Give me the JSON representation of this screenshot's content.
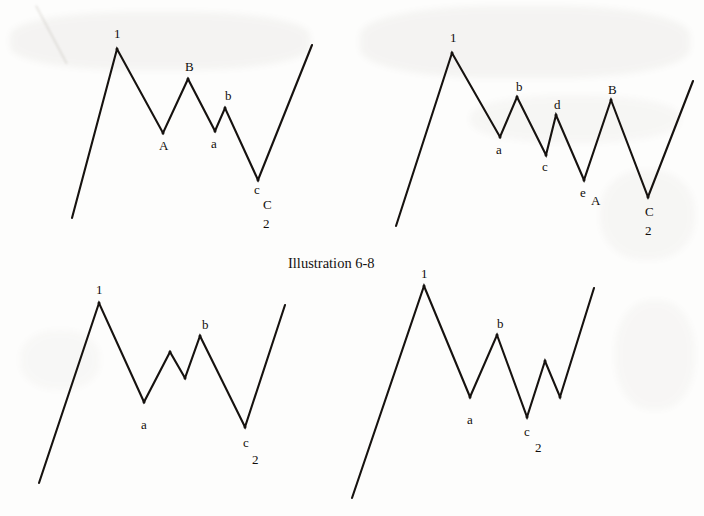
{
  "figure": {
    "caption": "Illustration 6-8",
    "caption_pos": {
      "x": 288,
      "y": 255
    },
    "background_color": "#fdfdfc",
    "line_color": "#16120f",
    "label_color": "#100d0b"
  },
  "charts": [
    {
      "id": "top-left",
      "name": "flat-correction-zigzag-top-left",
      "origin": {
        "x": 0,
        "y": 0
      },
      "points": [
        [
          72,
          218
        ],
        [
          117,
          49
        ],
        [
          163,
          133
        ],
        [
          188,
          79
        ],
        [
          215,
          131
        ],
        [
          225,
          108
        ],
        [
          258,
          180
        ],
        [
          312,
          45
        ]
      ],
      "labels": [
        {
          "text": "1",
          "x": 114,
          "y": 27
        },
        {
          "text": "A",
          "x": 159,
          "y": 139
        },
        {
          "text": "B",
          "x": 185,
          "y": 60
        },
        {
          "text": "a",
          "x": 211,
          "y": 137
        },
        {
          "text": "b",
          "x": 225,
          "y": 89
        },
        {
          "text": "c",
          "x": 254,
          "y": 183
        },
        {
          "text": "C",
          "x": 263,
          "y": 198
        },
        {
          "text": "2",
          "x": 263,
          "y": 217
        }
      ]
    },
    {
      "id": "top-right",
      "name": "zigzag-correction-top-right",
      "origin": {
        "x": 0,
        "y": 0
      },
      "points": [
        [
          396,
          226
        ],
        [
          452,
          53
        ],
        [
          500,
          137
        ],
        [
          517,
          97
        ],
        [
          546,
          155
        ],
        [
          556,
          115
        ],
        [
          584,
          180
        ],
        [
          611,
          100
        ],
        [
          648,
          197
        ],
        [
          693,
          81
        ]
      ],
      "labels": [
        {
          "text": "1",
          "x": 450,
          "y": 31
        },
        {
          "text": "a",
          "x": 496,
          "y": 143
        },
        {
          "text": "b",
          "x": 516,
          "y": 80
        },
        {
          "text": "c",
          "x": 542,
          "y": 160
        },
        {
          "text": "d",
          "x": 554,
          "y": 98
        },
        {
          "text": "e",
          "x": 580,
          "y": 186
        },
        {
          "text": "A",
          "x": 591,
          "y": 194
        },
        {
          "text": "B",
          "x": 608,
          "y": 83
        },
        {
          "text": "C",
          "x": 645,
          "y": 205
        },
        {
          "text": "2",
          "x": 645,
          "y": 224
        }
      ]
    },
    {
      "id": "bottom-left",
      "name": "zigzag-correction-bottom-left",
      "origin": {
        "x": 0,
        "y": 0
      },
      "points": [
        [
          39,
          483
        ],
        [
          99,
          303
        ],
        [
          144,
          402
        ],
        [
          170,
          352
        ],
        [
          185,
          378
        ],
        [
          200,
          336
        ],
        [
          245,
          427
        ],
        [
          285,
          305
        ]
      ],
      "labels": [
        {
          "text": "1",
          "x": 96,
          "y": 283
        },
        {
          "text": "a",
          "x": 141,
          "y": 418
        },
        {
          "text": "b",
          "x": 202,
          "y": 318
        },
        {
          "text": "c",
          "x": 243,
          "y": 436
        },
        {
          "text": "2",
          "x": 252,
          "y": 453
        }
      ]
    },
    {
      "id": "bottom-right",
      "name": "zigzag-correction-bottom-right",
      "origin": {
        "x": 0,
        "y": 0
      },
      "points": [
        [
          352,
          498
        ],
        [
          424,
          286
        ],
        [
          470,
          397
        ],
        [
          497,
          335
        ],
        [
          527,
          417
        ],
        [
          545,
          361
        ],
        [
          560,
          397
        ],
        [
          594,
          288
        ]
      ],
      "labels": [
        {
          "text": "1",
          "x": 421,
          "y": 267
        },
        {
          "text": "a",
          "x": 467,
          "y": 413
        },
        {
          "text": "b",
          "x": 497,
          "y": 317
        },
        {
          "text": "c",
          "x": 524,
          "y": 425
        },
        {
          "text": "2",
          "x": 535,
          "y": 441
        }
      ]
    }
  ]
}
